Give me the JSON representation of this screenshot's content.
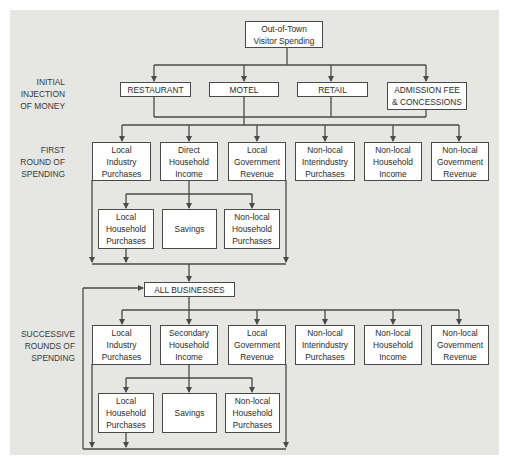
{
  "diagram": {
    "source": "Out-of-Town\nVisitor Spending",
    "stage_labels": {
      "initial": "INITIAL\nINJECTION\nOF MONEY",
      "first": "FIRST\nROUND OF\nSPENDING",
      "successive": "SUCCESSIVE\nROUNDS OF\nSPENDING"
    },
    "initial_injection": [
      "RESTAURANT",
      "MOTEL",
      "RETAIL",
      "ADMISSION FEE\n& CONCESSIONS"
    ],
    "first_round": [
      "Local\nIndustry\nPurchases",
      "Direct\nHousehold\nIncome",
      "Local\nGovernment\nRevenue",
      "Non-local\nInterindustry\nPurchases",
      "Non-local\nHousehold\nIncome",
      "Non-local\nGovernment\nRevenue"
    ],
    "first_household": [
      "Local\nHousehold\nPurchases",
      "Savings",
      "Non-local\nHousehold\nPurchases"
    ],
    "hub": "ALL BUSINESSES",
    "successive_round": [
      "Local\nIndustry\nPurchases",
      "Secondary\nHousehold\nIncome",
      "Local\nGovernment\nRevenue",
      "Non-local\nInterindustry\nPurchases",
      "Non-local\nHousehold\nIncome",
      "Non-local\nGovernment\nRevenue"
    ],
    "successive_household": [
      "Local\nHousehold\nPurchases",
      "Savings",
      "Non-local\nHousehold\nPurchases"
    ]
  },
  "colors": {
    "background": "#e6e6e3",
    "box": "#ffffff",
    "line": "#4a4a4a",
    "text": "#2b2b2b"
  }
}
